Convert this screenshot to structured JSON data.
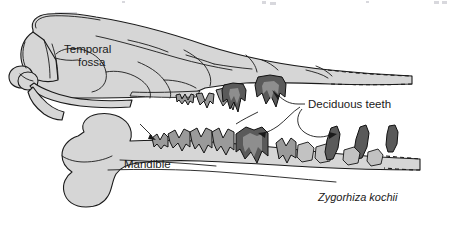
{
  "figure": {
    "name": "fossil-skull-diagram",
    "subject": "Zygorhiza kochii",
    "background_color": "#ffffff",
    "outline_color": "#1a1a1a",
    "bone_fill_color": "#d6d6d6",
    "tooth_mid_color": "#9a9a9a",
    "tooth_dark_color": "#5a5a5a",
    "tooth_light_color": "#c2c2c2"
  },
  "labels": {
    "temporal_fossa_line1": "Temporal",
    "temporal_fossa_line2": "fossa",
    "mandible": "Mandible",
    "deciduous_teeth": "Deciduous teeth",
    "species": "Zygorhiza kochii"
  },
  "structures": [
    {
      "name": "cranium",
      "label": "Temporal fossa"
    },
    {
      "name": "mandible",
      "label": "Mandible"
    },
    {
      "name": "upper-tooth-row",
      "teeth": 4
    },
    {
      "name": "lower-tooth-row",
      "teeth": 9
    }
  ]
}
